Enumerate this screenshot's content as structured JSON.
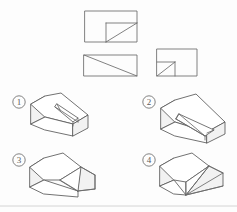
{
  "page": {
    "background_color": "#fdfdfd",
    "line_color": "#5f5f5f",
    "width": 237,
    "height": 212
  },
  "views": {
    "section_label": "orthographic-views",
    "items": [
      {
        "name": "top-view",
        "label": "Top View",
        "shape": "rectangle with inner rectangle at lower-right and diagonal",
        "outer": {
          "x": 85,
          "y": 11,
          "w": 52,
          "h": 31
        },
        "inner": {
          "x": 106,
          "y": 23,
          "w": 31,
          "h": 19
        },
        "diagonal": {
          "x1": 106,
          "y1": 42,
          "x2": 137,
          "y2": 23
        }
      },
      {
        "name": "front-view",
        "label": "Front View",
        "shape": "rectangle with diagonal from top-left to bottom-right",
        "outer": {
          "x": 84,
          "y": 55,
          "w": 53,
          "h": 21
        },
        "diagonal": {
          "x1": 84,
          "y1": 55,
          "x2": 137,
          "y2": 76
        }
      },
      {
        "name": "side-view",
        "label": "Side View",
        "shape": "rectangle with inner square at lower-left and diagonal",
        "outer": {
          "x": 157,
          "y": 49,
          "w": 40,
          "h": 27
        },
        "inner": {
          "x": 157,
          "y": 62,
          "w": 18,
          "h": 14
        },
        "diagonal": {
          "x1": 157,
          "y1": 76,
          "x2": 175,
          "y2": 62
        }
      }
    ]
  },
  "options": {
    "section_label": "answer-options",
    "items": [
      {
        "id": "1",
        "marker": "①",
        "number_text": "1",
        "name": "option-1",
        "description": "wedge solid with narrow slot groove on inclined face",
        "marker_pos": {
          "cx": 19,
          "cy": 102
        },
        "origin": {
          "x": 30,
          "y": 92
        }
      },
      {
        "id": "2",
        "marker": "②",
        "number_text": "2",
        "name": "option-2",
        "description": "wedge solid with wide triangular groove on inclined face",
        "marker_pos": {
          "cx": 149,
          "cy": 102
        },
        "origin": {
          "x": 160,
          "y": 92
        }
      },
      {
        "id": "3",
        "marker": "③",
        "number_text": "3",
        "name": "option-3",
        "description": "wedge solid with angled notch cut at right end",
        "marker_pos": {
          "cx": 19,
          "cy": 160
        },
        "origin": {
          "x": 30,
          "y": 150
        }
      },
      {
        "id": "4",
        "marker": "④",
        "number_text": "4",
        "name": "option-4",
        "description": "wedge solid with V-shaped notch converging to a point",
        "marker_pos": {
          "cx": 149,
          "cy": 160
        },
        "origin": {
          "x": 160,
          "y": 150
        }
      }
    ]
  },
  "footer": {
    "name": "footer-rule",
    "visible": true
  }
}
